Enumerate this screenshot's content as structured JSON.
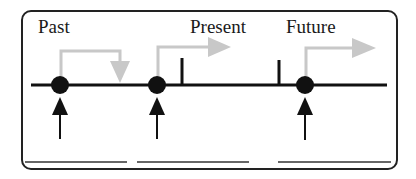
{
  "diagram": {
    "labels": {
      "past": "Past",
      "present": "Present",
      "future": "Future"
    },
    "colors": {
      "line": "#111111",
      "gray_arrow": "#c8c8c8",
      "frame": "#222222",
      "background": "#ffffff"
    },
    "events": [
      {
        "name": "past-event",
        "x": 60,
        "gray_arrow_direction": "down"
      },
      {
        "name": "present-event",
        "x": 157,
        "gray_arrow_direction": "right"
      },
      {
        "name": "future-event",
        "x": 305,
        "gray_arrow_direction": "right"
      }
    ],
    "tick_marks": [
      182,
      279
    ],
    "blank_lines": 3
  }
}
